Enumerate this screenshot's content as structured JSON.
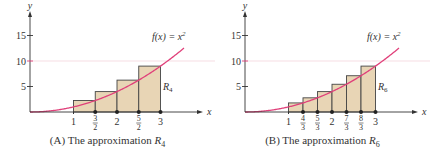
{
  "colors": {
    "curve": "#e0407a",
    "fill": "#e8d5b5",
    "axis": "#333333",
    "grid10": "#f0c8d0"
  },
  "chart_data": [
    {
      "type": "bar",
      "title": "(A) The approximation R4",
      "caption_prefix": "(A) The approximation ",
      "caption_var": "R",
      "caption_sub": "4",
      "function_label": "f(x) = x²",
      "region_label": "R",
      "region_sub": "4",
      "xlabel": "x",
      "ylabel": "y",
      "xlim": [
        0,
        3.4
      ],
      "ylim": [
        0,
        18
      ],
      "yticks": [
        "5",
        "10",
        "15"
      ],
      "xticks": [
        "1",
        "3/2",
        "2",
        "5/2",
        "3"
      ],
      "x": [
        1,
        1.5,
        2,
        2.5
      ],
      "right_endpoints": [
        1.5,
        2,
        2.5,
        3
      ],
      "values": [
        2.25,
        4,
        6.25,
        9
      ],
      "width": 0.5
    },
    {
      "type": "bar",
      "title": "(B) The approximation R6",
      "caption_prefix": "(B) The approximation ",
      "caption_var": "R",
      "caption_sub": "6",
      "function_label": "f(x) = x²",
      "region_label": "R",
      "region_sub": "6",
      "xlabel": "x",
      "ylabel": "y",
      "xlim": [
        0,
        3.4
      ],
      "ylim": [
        0,
        18
      ],
      "yticks": [
        "5",
        "10",
        "15"
      ],
      "xticks": [
        "1",
        "4/3",
        "5/3",
        "2",
        "7/3",
        "8/3",
        "3"
      ],
      "x": [
        1,
        1.3333,
        1.6667,
        2,
        2.3333,
        2.6667
      ],
      "right_endpoints": [
        1.3333,
        1.6667,
        2,
        2.3333,
        2.6667,
        3
      ],
      "values": [
        1.78,
        2.78,
        4,
        5.44,
        7.11,
        9
      ],
      "width": 0.3333
    }
  ]
}
